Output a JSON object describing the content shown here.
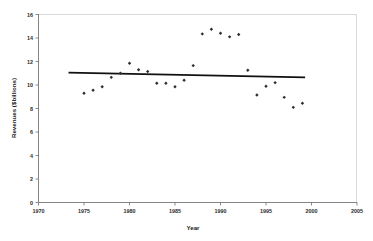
{
  "chart_data": {
    "type": "scatter",
    "title": "",
    "xlabel": "Year",
    "ylabel": "Revenues ($billions)",
    "xlim": [
      1970,
      2005
    ],
    "ylim": [
      0,
      16
    ],
    "xticks": [
      1970,
      1975,
      1980,
      1985,
      1990,
      1995,
      2000,
      2005
    ],
    "xtick_labels": [
      "1970",
      "1975",
      "1980",
      "1985",
      "1990",
      "1995",
      "2000",
      "2005"
    ],
    "yticks": [
      0,
      2,
      4,
      6,
      8,
      10,
      12,
      14,
      16
    ],
    "ytick_labels": [
      "0",
      "2",
      "4",
      "6",
      "8",
      "10",
      "12",
      "14",
      "16"
    ],
    "grid": false,
    "legend": false,
    "marker": "diamond",
    "marker_color": "#2e2e2e",
    "series": [
      {
        "name": "Revenues",
        "x": [
          1975,
          1976,
          1977,
          1978,
          1979,
          1980,
          1981,
          1982,
          1983,
          1984,
          1985,
          1986,
          1987,
          1988,
          1989,
          1990,
          1991,
          1992,
          1993,
          1994,
          1995,
          1996,
          1997,
          1998,
          1999
        ],
        "values": [
          9.3,
          9.55,
          9.85,
          10.65,
          11.0,
          11.85,
          11.3,
          11.15,
          10.15,
          10.15,
          9.85,
          10.4,
          11.65,
          14.35,
          14.75,
          14.4,
          14.1,
          14.3,
          11.25,
          9.15,
          9.9,
          10.2,
          8.95,
          8.1,
          8.45
        ]
      }
    ],
    "trend_line": {
      "name": "Linear trend",
      "x": [
        1973.3,
        1999.3
      ],
      "values": [
        11.05,
        10.65
      ],
      "color": "#111111"
    }
  }
}
